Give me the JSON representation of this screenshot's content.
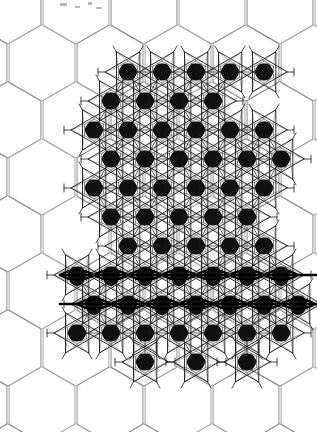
{
  "figure": {
    "name": "hexagonal-lattice-cluster-map",
    "type": "scientific-structure-diagram",
    "caption": "",
    "width": 317,
    "height": 432,
    "background_color": "#ffffff"
  },
  "colors": {
    "background": "#ffffff",
    "lattice_line": "#a8a8a8",
    "lattice_line_dark": "#8e8e8e",
    "cluster_line": "#1a1a1a",
    "cluster_line_faint": "#6a6a6a",
    "blob_fill": "#101010",
    "bold_chain": "#000000",
    "speck": "#b8b8b8"
  },
  "lattice": {
    "name": "honeycomb-background-lattice",
    "orientation": "pointy-top",
    "circumradius": 38,
    "horizontal_pitch": 68,
    "vertical_pitch": 57,
    "origin_x": 8,
    "origin_y": 6,
    "columns": 6,
    "rows": 9,
    "line_width": 1.0
  },
  "cluster_motif": {
    "name": "six-pointed-star-cluster",
    "description": "hexagram outline with inner hexagon, radial spokes and solid central blob",
    "star_outer_radius": 23,
    "star_inner_radius": 11,
    "inner_hex_radius": 9,
    "blob_radius_x": 9,
    "blob_radius_y": 8.5,
    "spoke_length": 30,
    "line_width": 0.9
  },
  "chart_data": {
    "type": "scatter",
    "title": "",
    "xlabel": "",
    "ylabel": "",
    "xlim": [
      0,
      317
    ],
    "ylim": [
      0,
      432
    ],
    "grid": true,
    "legend": false,
    "series": [
      {
        "name": "cluster-sites",
        "marker": "filled-blob-with-star",
        "points": [
          [
            128,
            72
          ],
          [
            162,
            72
          ],
          [
            196,
            72
          ],
          [
            230,
            72
          ],
          [
            264,
            72
          ],
          [
            111,
            101
          ],
          [
            145,
            101
          ],
          [
            179,
            101
          ],
          [
            213,
            101
          ],
          [
            94,
            130
          ],
          [
            128,
            130
          ],
          [
            162,
            130
          ],
          [
            196,
            130
          ],
          [
            230,
            130
          ],
          [
            264,
            130
          ],
          [
            111,
            159
          ],
          [
            145,
            159
          ],
          [
            179,
            159
          ],
          [
            213,
            159
          ],
          [
            247,
            159
          ],
          [
            281,
            159
          ],
          [
            94,
            188
          ],
          [
            128,
            188
          ],
          [
            162,
            188
          ],
          [
            196,
            188
          ],
          [
            230,
            188
          ],
          [
            264,
            188
          ],
          [
            111,
            217
          ],
          [
            145,
            217
          ],
          [
            179,
            217
          ],
          [
            213,
            217
          ],
          [
            247,
            217
          ],
          [
            128,
            246
          ],
          [
            162,
            246
          ],
          [
            196,
            246
          ],
          [
            230,
            246
          ],
          [
            264,
            246
          ],
          [
            77,
            275
          ],
          [
            111,
            275
          ],
          [
            145,
            275
          ],
          [
            179,
            275
          ],
          [
            213,
            275
          ],
          [
            247,
            275
          ],
          [
            281,
            275
          ],
          [
            94,
            304
          ],
          [
            128,
            304
          ],
          [
            162,
            304
          ],
          [
            196,
            304
          ],
          [
            230,
            304
          ],
          [
            264,
            304
          ],
          [
            298,
            304
          ],
          [
            77,
            333
          ],
          [
            111,
            333
          ],
          [
            145,
            333
          ],
          [
            179,
            333
          ],
          [
            213,
            333
          ],
          [
            247,
            333
          ],
          [
            281,
            333
          ],
          [
            145,
            362
          ],
          [
            196,
            362
          ],
          [
            247,
            362
          ]
        ]
      }
    ]
  },
  "emphasis_chains": {
    "name": "bold-horizontal-chain-bands",
    "description": "Heavy horizontal connector lines drawn through two rows of cluster sites.",
    "line_width": 2.6,
    "bands": [
      {
        "y": 275,
        "x_start": 60,
        "x_end": 317
      },
      {
        "y": 304,
        "x_start": 60,
        "x_end": 317
      }
    ]
  },
  "dense_region": {
    "name": "decorated-domain-bounds",
    "x_min": 60,
    "x_max": 317,
    "y_min": 52,
    "y_max": 382
  },
  "artifacts": {
    "name": "scan-specks",
    "items": [
      {
        "x": 60,
        "y": 3,
        "w": 7,
        "h": 3
      },
      {
        "x": 75,
        "y": 6,
        "w": 5,
        "h": 2
      },
      {
        "x": 88,
        "y": 2,
        "w": 4,
        "h": 3
      },
      {
        "x": 96,
        "y": 7,
        "w": 6,
        "h": 2
      }
    ]
  }
}
